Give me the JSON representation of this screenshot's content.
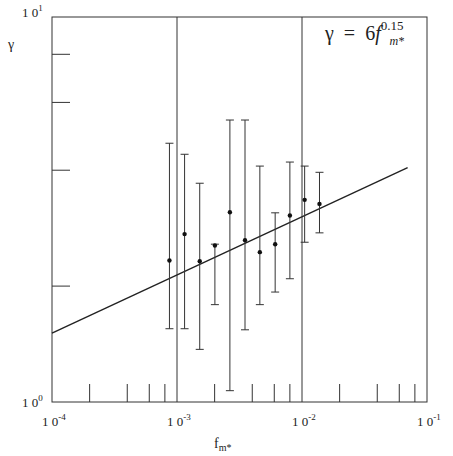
{
  "chart_data": {
    "type": "scatter",
    "title": "",
    "xlabel": "f_m*",
    "ylabel": "γ",
    "xscale": "log",
    "yscale": "log",
    "xlim": [
      0.0001,
      0.1
    ],
    "ylim": [
      1,
      10
    ],
    "x_tick_labels": [
      "10^-4",
      "10^-3",
      "10^-2",
      "10^-1"
    ],
    "y_tick_labels": [
      "10^0",
      "10^1"
    ],
    "grid": "vertical lines at decades 10^-3 and 10^-2",
    "annotation": "γ = 6 f_m*^0.15",
    "series": [
      {
        "name": "data with error bars",
        "x": [
          0.00087,
          0.00115,
          0.00152,
          0.00201,
          0.00265,
          0.0035,
          0.0046,
          0.0061,
          0.008,
          0.0105,
          0.0138
        ],
        "y": [
          2.33,
          2.73,
          2.32,
          2.55,
          3.11,
          2.63,
          2.45,
          2.57,
          3.05,
          3.35,
          3.27
        ],
        "y_err_upper": [
          4.7,
          4.4,
          3.7,
          2.57,
          5.4,
          5.4,
          4.1,
          3.1,
          4.2,
          4.1,
          3.95
        ],
        "y_err_lower": [
          1.55,
          1.55,
          1.37,
          1.79,
          1.07,
          1.54,
          1.79,
          1.93,
          2.09,
          2.6,
          2.75
        ]
      },
      {
        "name": "fit",
        "type": "line",
        "formula": "6 * f^0.15",
        "x": [
          0.0001,
          0.07
        ],
        "y": [
          1.51,
          4.06
        ]
      }
    ]
  },
  "labels": {
    "y_top": "1 0",
    "y_top_exp": "1",
    "y_bottom": "1 0",
    "y_bottom_exp": "0",
    "x0": "1 0",
    "x0_exp": "-4",
    "x1": "1 0",
    "x1_exp": "-3",
    "x2": "1 0",
    "x2_exp": "-2",
    "x3": "1 0",
    "x3_exp": "-1",
    "y_axis_title": "γ",
    "x_axis_title": "f",
    "x_axis_title_sub": "m*",
    "eq_lhs": "γ",
    "eq_eq": "=",
    "eq_coef": "6",
    "eq_var": "f",
    "eq_exp": "0.15",
    "eq_sub": "m*"
  }
}
